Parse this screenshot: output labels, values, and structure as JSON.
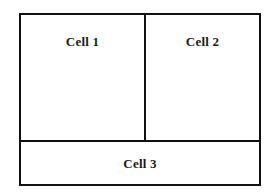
{
  "diagram": {
    "type": "table-cell-layout",
    "background_color": "#ffffff",
    "stroke_color": "#111111",
    "text_color": "#1a1a1a",
    "border_width_px": 2,
    "frame": {
      "left": 19,
      "top": 13,
      "width": 242,
      "height": 173
    },
    "dividers": {
      "vertical_x": 144,
      "horizontal_y": 140
    },
    "rows": [
      {
        "name": "top-row",
        "cells": [
          {
            "id": "cell-1",
            "label": "Cell 1",
            "span": 1,
            "align": "center"
          },
          {
            "id": "cell-2",
            "label": "Cell 2",
            "span": 1,
            "align": "center"
          }
        ]
      },
      {
        "name": "bottom-row",
        "cells": [
          {
            "id": "cell-3",
            "label": "Cell 3",
            "span": 2,
            "align": "center"
          }
        ]
      }
    ]
  }
}
